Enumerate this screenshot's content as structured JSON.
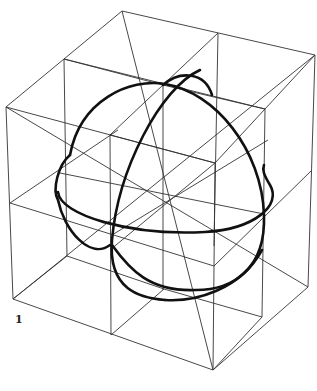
{
  "diagram": {
    "title": "",
    "label": "1",
    "colors": {
      "background": "#ffffff",
      "wireframe": "#333333",
      "curve": "#111111"
    },
    "cube_vertices": {
      "top_back": [
        122,
        11
      ],
      "top_right": [
        315,
        55
      ],
      "top_left": [
        6,
        107
      ],
      "top_front": [
        215,
        163
      ],
      "bottom_left": [
        13,
        299
      ],
      "bottom_right": [
        308,
        287
      ],
      "bottom_front": [
        213,
        370
      ],
      "center": [
        163,
        183
      ]
    }
  }
}
